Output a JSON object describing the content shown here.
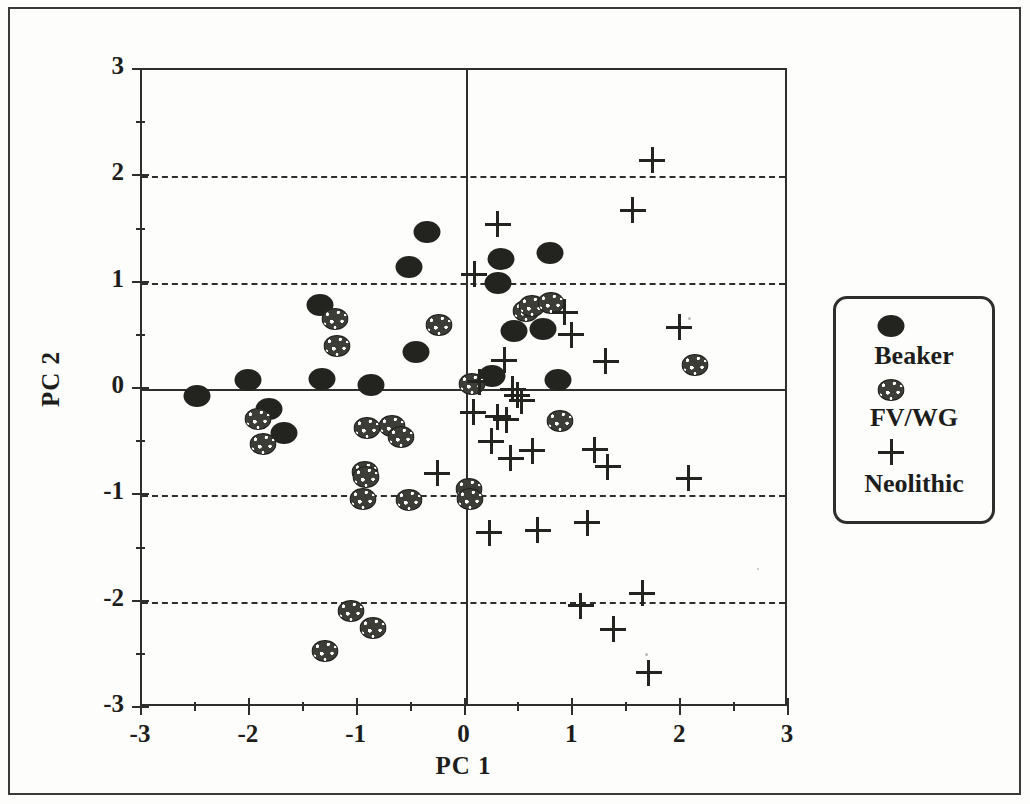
{
  "figure": {
    "background_color": "#fdfdfc",
    "ink_color": "#1d1d1b",
    "width": 1030,
    "height": 804
  },
  "axes": {
    "xlabel": "PC 1",
    "ylabel": "PC 2",
    "x_ticks": [
      "-3",
      "-2",
      "-1",
      "0",
      "1",
      "2",
      "3"
    ],
    "y_ticks": [
      "3",
      "2",
      "1",
      "0",
      "-1",
      "-2",
      "-3"
    ],
    "x_minor_step": 0.5,
    "y_minor_step": 0.5
  },
  "legend": {
    "title": "",
    "entries": [
      {
        "label": "Beaker",
        "marker": "filled-ellipse",
        "color": "#23231f"
      },
      {
        "label": "FV/WG",
        "marker": "stippled-ellipse",
        "color": "#3d3d38"
      },
      {
        "label": "Neolithic",
        "marker": "plus",
        "color": "#232320"
      }
    ]
  },
  "chart_data": {
    "type": "scatter",
    "title": "",
    "xlabel": "PC 1",
    "ylabel": "PC 2",
    "xlim": [
      -3,
      3
    ],
    "ylim": [
      -3,
      3
    ],
    "grid": "dashed horizontal gridlines at PC2 = 2, 1, -1, -2; solid reference lines at PC2 = 0 and PC1 = 0",
    "legend_position": "right-outside",
    "series": [
      {
        "name": "Beaker",
        "marker": "filled-ellipse",
        "color": "#23231f",
        "points": [
          [
            -2.49,
            -0.07
          ],
          [
            -2.02,
            0.08
          ],
          [
            -1.82,
            -0.19
          ],
          [
            -1.68,
            -0.41
          ],
          [
            -1.35,
            0.79
          ],
          [
            -1.33,
            0.09
          ],
          [
            -0.88,
            0.04
          ],
          [
            -0.46,
            0.35
          ],
          [
            -0.36,
            1.48
          ],
          [
            -0.52,
            1.15
          ],
          [
            0.25,
            0.12
          ],
          [
            0.3,
            1.0
          ],
          [
            0.33,
            1.22
          ],
          [
            0.45,
            0.55
          ],
          [
            0.72,
            0.56
          ],
          [
            0.78,
            1.28
          ],
          [
            0.86,
            0.08
          ]
        ]
      },
      {
        "name": "FV/WG",
        "marker": "stippled-ellipse",
        "color": "#3d3d38",
        "points": [
          [
            -1.92,
            -0.28
          ],
          [
            -1.88,
            -0.52
          ],
          [
            -1.21,
            0.66
          ],
          [
            -1.19,
            0.4
          ],
          [
            -0.95,
            -1.03
          ],
          [
            -0.93,
            -0.78
          ],
          [
            -0.92,
            -0.83
          ],
          [
            -0.91,
            -0.37
          ],
          [
            -0.68,
            -0.35
          ],
          [
            -0.6,
            -0.45
          ],
          [
            -0.52,
            -1.04
          ],
          [
            -0.25,
            0.6
          ],
          [
            0.03,
            -0.94
          ],
          [
            0.04,
            -1.03
          ],
          [
            0.06,
            0.05
          ],
          [
            0.56,
            0.73
          ],
          [
            0.62,
            0.78
          ],
          [
            0.79,
            0.81
          ],
          [
            0.88,
            -0.3
          ],
          [
            2.13,
            0.23
          ],
          [
            -1.06,
            -2.09
          ],
          [
            -0.86,
            -2.25
          ],
          [
            -1.3,
            -2.46
          ]
        ]
      },
      {
        "name": "Neolithic",
        "marker": "plus",
        "color": "#232320",
        "points": [
          [
            0.08,
            1.08
          ],
          [
            0.3,
            1.55
          ],
          [
            1.73,
            2.15
          ],
          [
            1.55,
            1.68
          ],
          [
            0.92,
            0.72
          ],
          [
            0.98,
            0.51
          ],
          [
            0.36,
            0.27
          ],
          [
            1.3,
            0.26
          ],
          [
            0.13,
            0.07
          ],
          [
            0.44,
            0.0
          ],
          [
            0.48,
            -0.06
          ],
          [
            0.52,
            -0.11
          ],
          [
            0.07,
            -0.22
          ],
          [
            0.3,
            -0.26
          ],
          [
            0.38,
            -0.29
          ],
          [
            1.98,
            0.58
          ],
          [
            0.24,
            -0.49
          ],
          [
            0.42,
            -0.65
          ],
          [
            0.62,
            -0.58
          ],
          [
            1.2,
            -0.57
          ],
          [
            1.32,
            -0.73
          ],
          [
            -0.26,
            -0.79
          ],
          [
            0.22,
            -1.35
          ],
          [
            0.67,
            -1.33
          ],
          [
            1.13,
            -1.26
          ],
          [
            1.07,
            -2.04
          ],
          [
            1.64,
            -1.92
          ],
          [
            1.37,
            -2.26
          ],
          [
            1.7,
            -2.67
          ],
          [
            2.07,
            -0.84
          ]
        ]
      }
    ]
  }
}
